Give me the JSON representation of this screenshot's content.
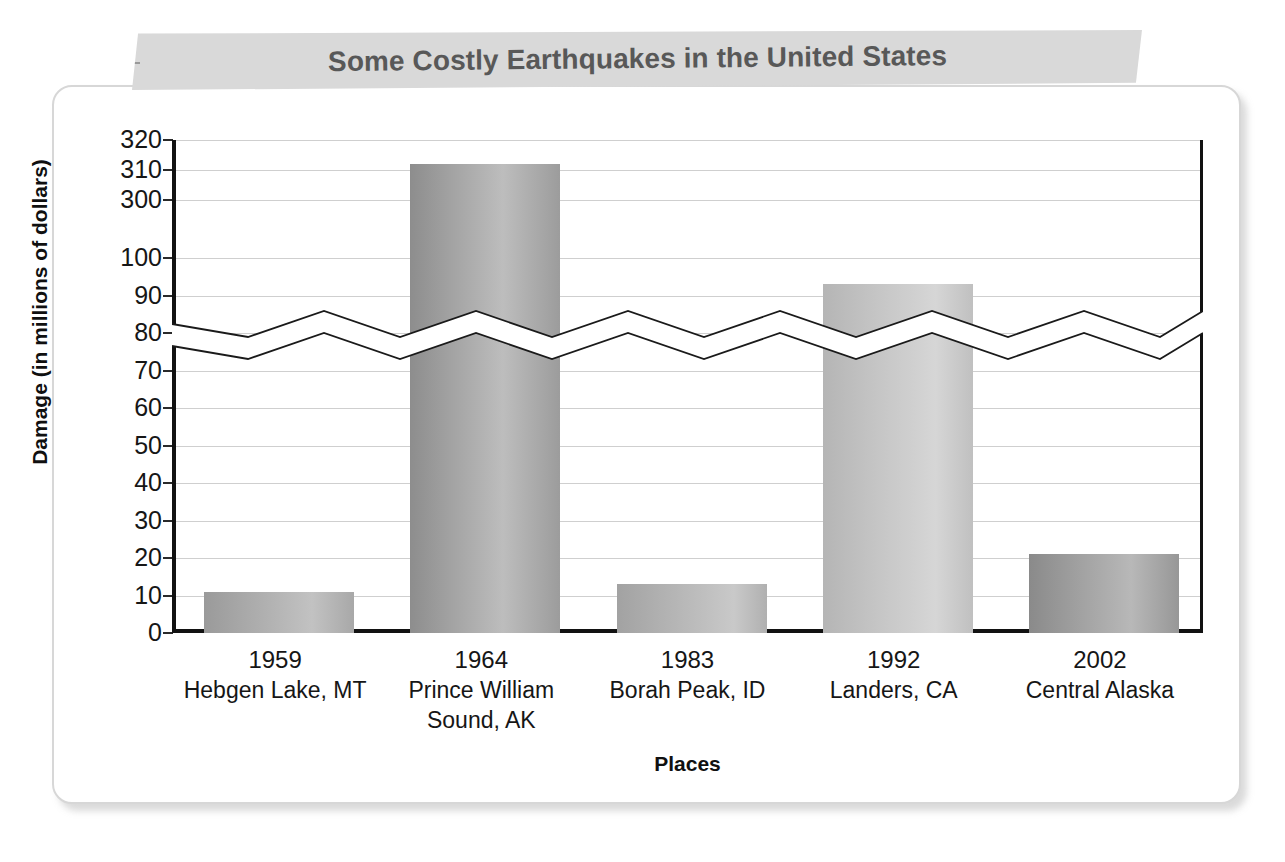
{
  "chart_data": {
    "type": "bar",
    "title": "Some Costly Earthquakes in the United States",
    "xlabel": "Places",
    "ylabel": "Damage (in millions of dollars)",
    "categories": [
      "1959 Hebgen Lake, MT",
      "1964 Prince William Sound, AK",
      "1983 Borah Peak, ID",
      "1992 Landers, CA",
      "2002 Central Alaska"
    ],
    "values": [
      11,
      312,
      13,
      93,
      21
    ],
    "grid": true,
    "legend": "none",
    "axis_break": {
      "present": true,
      "lower_max": 100,
      "upper_min": 300
    },
    "ylim": [
      0,
      320
    ],
    "ytick_labels": [
      "320",
      "310",
      "300",
      "100",
      "90",
      "80",
      "70",
      "60",
      "50",
      "40",
      "30",
      "20",
      "10",
      "0"
    ],
    "ytick_values": [
      320,
      310,
      300,
      100,
      90,
      80,
      70,
      60,
      50,
      40,
      30,
      20,
      10,
      0
    ],
    "points": [
      {
        "category": "1959 Hebgen Lake, MT",
        "year": "1959",
        "place": "Hebgen Lake, MT",
        "value": 11
      },
      {
        "category": "1964 Prince William Sound, AK",
        "year": "1964",
        "place": "Prince William Sound, AK",
        "value": 312
      },
      {
        "category": "1983 Borah Peak, ID",
        "year": "1983",
        "place": "Borah Peak, ID",
        "value": 13
      },
      {
        "category": "1992 Landers, CA",
        "year": "1992",
        "place": "Landers, CA",
        "value": 93
      },
      {
        "category": "2002 Central Alaska",
        "year": "2002",
        "place": "Central Alaska",
        "value": 21
      }
    ]
  },
  "banner": {
    "title": "Some Costly Earthquakes in the United States",
    "background_color": "#d9d9d9",
    "text_color": "#585858"
  },
  "axes": {
    "y_title": "Damage (in millions of dollars)",
    "x_title": "Places",
    "y_ticks": [
      "320",
      "310",
      "300",
      "100",
      "90",
      "80",
      "70",
      "60",
      "50",
      "40",
      "30",
      "20",
      "10",
      "0"
    ]
  },
  "x_categories": [
    {
      "year": "1959",
      "line1": "Hebgen Lake, MT",
      "line2": ""
    },
    {
      "year": "1964",
      "line1": "Prince William",
      "line2": "Sound, AK"
    },
    {
      "year": "1983",
      "line1": "Borah Peak, ID",
      "line2": ""
    },
    {
      "year": "1992",
      "line1": "Landers, CA",
      "line2": ""
    },
    {
      "year": "2002",
      "line1": "Central Alaska",
      "line2": ""
    }
  ],
  "colors": {
    "axis": "#121212",
    "gridline": "#cfcfcf",
    "card_border": "#d7d7d7",
    "bar_light": "#d6d6d6",
    "bar_dark": "#8a8a8a"
  }
}
